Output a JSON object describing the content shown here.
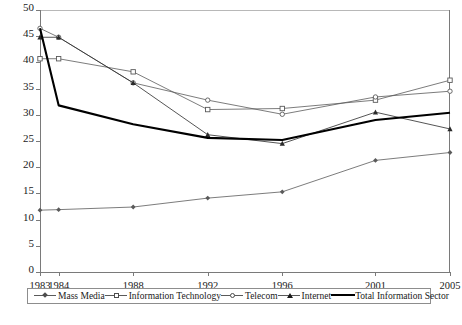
{
  "chart_data": {
    "type": "line",
    "title": "",
    "subtitle": "",
    "xlabel": "",
    "ylabel": "",
    "x": [
      1983,
      1984,
      1988,
      1992,
      1996,
      2001,
      2005
    ],
    "xticklabels": [
      "1983",
      "1984",
      "1988",
      "1992",
      "1996",
      "2001",
      "2005"
    ],
    "xlim": [
      1983,
      2005
    ],
    "ylim": [
      0,
      50
    ],
    "yticks": [
      0,
      5,
      10,
      15,
      20,
      25,
      30,
      35,
      40,
      45,
      50
    ],
    "yticklabels": [
      "0",
      "5",
      "10",
      "15",
      "20",
      "25",
      "30",
      "35",
      "40",
      "45",
      "50"
    ],
    "grid": false,
    "legend_position": "bottom",
    "series": [
      {
        "name": "Mass Media",
        "marker": "diamond",
        "color": "#5a5a5a",
        "values": [
          11.8,
          11.9,
          12.4,
          14.1,
          15.3,
          21.3,
          22.8
        ]
      },
      {
        "name": "Information Technology",
        "marker": "open-square",
        "color": "#5a5a5a",
        "values": [
          40.7,
          40.7,
          38.2,
          31.0,
          31.2,
          32.8,
          36.6
        ]
      },
      {
        "name": "Telecom",
        "marker": "open-circle",
        "color": "#5a5a5a",
        "values": [
          46.5,
          44.8,
          36.1,
          32.8,
          30.1,
          33.4,
          34.5
        ]
      },
      {
        "name": "Internet",
        "marker": "filled-triangle",
        "color": "#2a2a2a",
        "values": [
          44.8,
          44.8,
          36.1,
          26.2,
          24.5,
          30.5,
          27.3
        ]
      },
      {
        "name": "Total Information Sector",
        "marker": "none",
        "color": "#000000",
        "values": [
          46.5,
          31.8,
          28.2,
          25.6,
          25.2,
          29.0,
          30.4
        ]
      }
    ]
  },
  "legend": {
    "items": [
      {
        "label": "Mass Media",
        "marker": "diamond-icon"
      },
      {
        "label": "Information Technology",
        "marker": "open-square-icon"
      },
      {
        "label": "Telecom",
        "marker": "open-circle-icon"
      },
      {
        "label": "Internet",
        "marker": "filled-triangle-icon"
      },
      {
        "label": "Total Information Sector",
        "marker": "thick-line-icon"
      }
    ]
  },
  "caption": {
    "text": ""
  }
}
